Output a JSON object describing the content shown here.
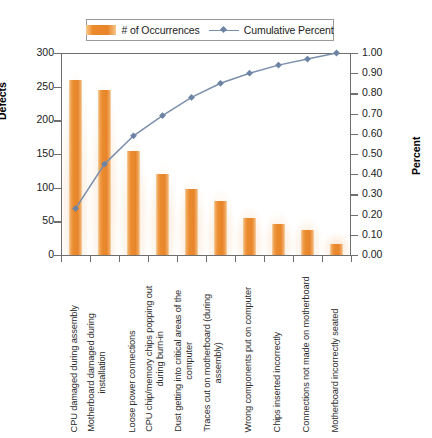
{
  "chart_data": {
    "type": "bar",
    "title": "",
    "subtitle": "",
    "xlabel": "",
    "ylabel": "Defects",
    "y2label": "Percent",
    "ylim": [
      0,
      300
    ],
    "y2lim": [
      0.0,
      1.0
    ],
    "yticks": [
      300,
      250,
      200,
      150,
      100,
      50,
      0
    ],
    "y2ticks": [
      "1.00",
      "0.90",
      "0.80",
      "0.70",
      "0.60",
      "0.50",
      "0.40",
      "0.30",
      "0.20",
      "0.10",
      "0.00"
    ],
    "grid": false,
    "legend_position": "top-center",
    "legend": [
      "# of Occurrences",
      "Cumulative Percent"
    ],
    "categories": [
      "CPU damaged during assembly",
      "Motherboard damaged during installation",
      "Loose power connections",
      "CPU chip/memory chips popping out during burn-in",
      "Dust getting into critical areas of the computer",
      "Traces cut on motherboard (during assembly)",
      "Wrong components put on computer",
      "Chips inserted incorrectly",
      "Connections not made on motherboard",
      "Motherboard incorrectly seated"
    ],
    "category_lines": [
      [
        "CPU damaged during assembly"
      ],
      [
        "Motherboard damaged during",
        "installation"
      ],
      [
        "Loose power connections"
      ],
      [
        "CPU chip/memory chips popping out",
        "during burn-in"
      ],
      [
        "Dust getting into critical areas of the",
        "computer"
      ],
      [
        "Traces cut on motherboard (during",
        "assembly)"
      ],
      [
        "Wrong components put on computer"
      ],
      [
        "Chips inserted incorrectly"
      ],
      [
        "Connections not made on motherboard"
      ],
      [
        "Motherboard incorrectly seated"
      ]
    ],
    "series": [
      {
        "name": "# of Occurrences",
        "type": "bar",
        "axis": "left",
        "color": "#e8852a",
        "values": [
          260,
          245,
          155,
          120,
          98,
          80,
          55,
          46,
          37,
          17
        ]
      },
      {
        "name": "Cumulative Percent",
        "type": "line",
        "axis": "right",
        "color": "#7b8fad",
        "values": [
          0.23,
          0.45,
          0.59,
          0.69,
          0.78,
          0.85,
          0.9,
          0.94,
          0.97,
          1.0
        ]
      }
    ]
  },
  "colors": {
    "bar": "#e8852a",
    "bar_light": "#f9d3a4",
    "line": "#7b8fad",
    "marker": "#6d83a3",
    "axis": "#6f6f6f",
    "text": "#1b1b1b",
    "background": "#ffffff"
  }
}
